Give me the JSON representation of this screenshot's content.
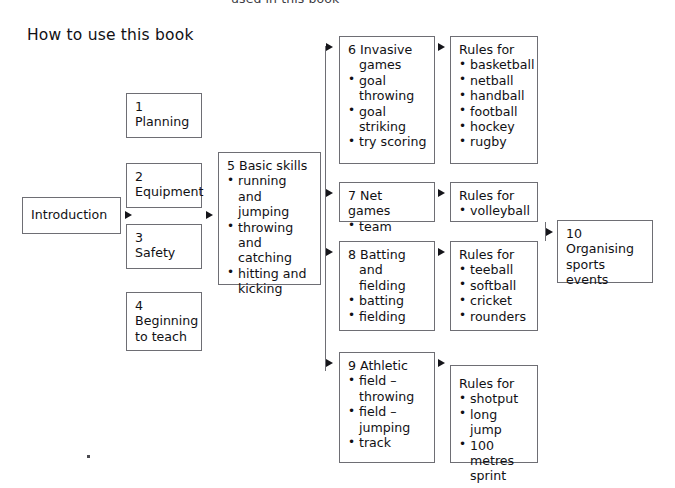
{
  "page": {
    "top_caption": "used in this book",
    "title": "How to use this book",
    "width": 675,
    "height": 488,
    "background": "#ffffff",
    "box_border_color": "#6e6e74",
    "text_color": "#111114",
    "arrow_color": "#15151a"
  },
  "nodes": {
    "introduction": {
      "header": "Introduction",
      "items": []
    },
    "n1": {
      "header": "1\nPlanning",
      "items": []
    },
    "n2": {
      "header": "2\nEquipment",
      "items": []
    },
    "n3": {
      "header": "3\nSafety",
      "items": []
    },
    "n4": {
      "header": "4\nBeginning\nto teach",
      "items": []
    },
    "n5": {
      "header": "5 Basic skills",
      "items": [
        "running and\njumping",
        "throwing\nand catching",
        "hitting and\nkicking"
      ]
    },
    "n6": {
      "header": "6 Invasive\ngames",
      "items": [
        "goal\nthrowing",
        "goal\nstriking",
        "try scoring"
      ]
    },
    "n6_rules": {
      "header": "Rules for",
      "items": [
        "basketball",
        "netball",
        "handball",
        "football",
        "hockey",
        "rugby"
      ]
    },
    "n7": {
      "header": "7 Net games",
      "items": [
        "team"
      ]
    },
    "n7_rules": {
      "header": "Rules for",
      "items": [
        "volleyball"
      ]
    },
    "n8": {
      "header": "8 Batting\nand\nfielding",
      "items": [
        "batting",
        "fielding"
      ]
    },
    "n8_rules": {
      "header": "Rules for",
      "items": [
        "teeball",
        "softball",
        "cricket",
        "rounders"
      ]
    },
    "n9": {
      "header": "9 Athletic",
      "items": [
        "field –\nthrowing",
        "field –\njumping",
        "track"
      ]
    },
    "n9_rules": {
      "header": "Rules for",
      "items": [
        "shotput",
        "long jump",
        "100 metres\nsprint"
      ]
    },
    "n10": {
      "header": "10\nOrganising\nsports events",
      "items": []
    }
  },
  "flow": {
    "arrow_labels": [
      "introduction-to-chapters",
      "chapters-to-basic-skills",
      "basic-skills-to-invasive-games",
      "basic-skills-to-net-games",
      "basic-skills-to-batting-fielding",
      "basic-skills-to-athletic",
      "invasive-games-to-rules",
      "net-games-to-rules",
      "batting-fielding-to-rules",
      "athletic-to-rules",
      "rules-to-organising-sports-events"
    ]
  }
}
